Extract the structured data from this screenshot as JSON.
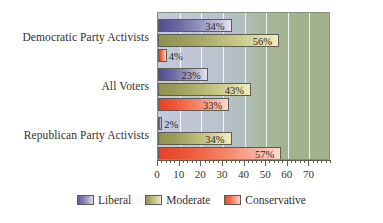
{
  "chart_data": {
    "type": "bar",
    "orientation": "horizontal",
    "title": "",
    "xlabel": "",
    "ylabel": "",
    "categories": [
      "Democratic Party Activists",
      "All Voters",
      "Republican Party Activists"
    ],
    "series": [
      {
        "name": "Liberal",
        "color": "#5d5b99",
        "values": [
          34,
          23,
          2
        ]
      },
      {
        "name": "Moderate",
        "color": "#969751",
        "values": [
          56,
          43,
          34
        ]
      },
      {
        "name": "Conservative",
        "color": "#ea4a2c",
        "values": [
          4,
          33,
          57
        ]
      }
    ],
    "value_labels": [
      [
        "34%",
        "56%",
        "4%"
      ],
      [
        "23%",
        "43%",
        "33%"
      ],
      [
        "2%",
        "34%",
        "57%"
      ]
    ],
    "xlim": [
      0,
      80
    ],
    "xticks": [
      0,
      10,
      20,
      30,
      40,
      50,
      60,
      70
    ],
    "xtick_labels": [
      "0",
      "10",
      "20",
      "30",
      "40",
      "50",
      "60",
      "70"
    ],
    "minor_tick_step": 2,
    "gridlines": [
      10,
      20,
      30,
      40,
      50,
      60,
      70
    ],
    "grid": true,
    "grid_color": "#ffffff",
    "legend_position": "bottom",
    "plot_background_left": "#c3c9dd",
    "plot_background_right": "#a3b28c"
  },
  "legend": {
    "items": [
      {
        "label": "Liberal"
      },
      {
        "label": "Moderate"
      },
      {
        "label": "Conservative"
      }
    ]
  }
}
